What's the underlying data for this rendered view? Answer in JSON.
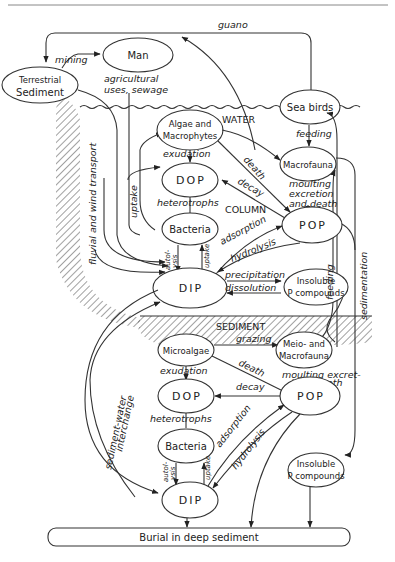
{
  "diagram": {
    "nodes": {
      "man": "Man",
      "terrestrial_1": "Terrestrial",
      "terrestrial_2": "Sediment",
      "algae_1": "Algae and",
      "algae_2": "Macrophytes",
      "sea_birds": "Sea birds",
      "macrofauna": "Macrofauna",
      "dop_water": "DOP",
      "bacteria_water": "Bacteria",
      "pop_water": "POP",
      "dip_water": "DIP",
      "insoluble_water_1": "Insoluble",
      "insoluble_water_2": "P compounds",
      "microalgae": "Microalgae",
      "meio_1": "Meio- and",
      "meio_2": "Macrofauna",
      "dop_sed": "DOP",
      "pop_sed": "POP",
      "bacteria_sed": "Bacteria",
      "dip_sed": "DIP",
      "insoluble_sed_1": "Insoluble",
      "insoluble_sed_2": "P compounds",
      "burial": "Burial in deep sediment"
    },
    "regions": {
      "water": "WATER",
      "column": "COLUMN",
      "sediment": "SEDIMENT"
    },
    "edge_labels": {
      "guano": "guano",
      "mining": "mining",
      "agri_1": "agricultural",
      "agri_2": "uses, sewage",
      "fluvial": "fluvial and wind transport",
      "uptake_water": "uptake",
      "exudation_water": "exudation",
      "heterotrophs_water": "heterotrophs",
      "death_water": "death",
      "decay_water": "decay",
      "feeding_birds": "feeding",
      "moulting_1": "moulting",
      "moulting_2": "excretion",
      "moulting_3": "and death",
      "adsorption_water": "adsorption",
      "hydrolysis_water": "hydrolysis",
      "precipitation": "precipitation",
      "dissolution": "dissolution",
      "autolysis_water_1": "autol-",
      "autolysis_water_2": "ysis",
      "uptake_bact_water": "uptake",
      "feeding_right": "feeding",
      "sedimentation": "sedimentation",
      "grazing": "grazing",
      "death_sed": "death",
      "moulting_sed_1": "moulting excret-",
      "moulting_sed_2": "ion",
      "moulting_sed_3": "death",
      "exudation_sed": "exudation",
      "decay_sed": "decay",
      "heterotrophs_sed": "heterotrophs",
      "adsorption_sed": "adsorption",
      "hydrolysis_sed": "hydrolysis",
      "interchange_1": "sediment-water",
      "interchange_2": "interchange",
      "autolysis_sed_1": "autol-",
      "autolysis_sed_2": "ysis",
      "uptake_bact_sed": "uptake"
    }
  }
}
